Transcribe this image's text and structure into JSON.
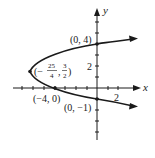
{
  "figure": {
    "equation": "x = y^2 - 3y - 4",
    "axes": {
      "x_label": "x",
      "y_label": "y",
      "x_tick_label": "2",
      "y_tick_label": "2",
      "x_range": [
        -7,
        3
      ],
      "y_range": [
        -6,
        6
      ],
      "tick_spacing": 1
    },
    "points": [
      {
        "name": "y-intercept-top",
        "label": "(0, 4)",
        "x": 0,
        "y": 4
      },
      {
        "name": "vertex",
        "label_prefix": "(−",
        "label_num1": "25",
        "label_den1": "4",
        "label_num2": "3",
        "label_den2": "2",
        "label_suffix": ")",
        "x": -6.25,
        "y": 1.5
      },
      {
        "name": "x-intercept",
        "label": "(−4, 0)",
        "x": -4,
        "y": 0
      },
      {
        "name": "y-intercept-bottom",
        "label": "(0, −1)",
        "x": 0,
        "y": -1
      }
    ],
    "colors": {
      "curve": "#1a1a1a",
      "axes": "#1a1a1a",
      "background": "#ffffff"
    }
  }
}
